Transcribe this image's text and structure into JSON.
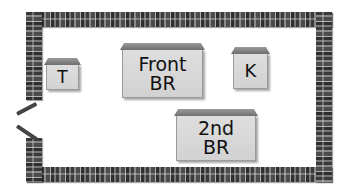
{
  "diagram": {
    "type": "floor-plan",
    "rooms": [
      {
        "id": "t",
        "label_lines": [
          "T"
        ]
      },
      {
        "id": "front-br",
        "label_lines": [
          "Front",
          "BR"
        ]
      },
      {
        "id": "k",
        "label_lines": [
          "K"
        ]
      },
      {
        "id": "2nd-br",
        "label_lines": [
          "2nd",
          "BR"
        ]
      }
    ],
    "features": [
      "outer-walls",
      "door-opening-left"
    ],
    "colors": {
      "wall": "#4a4a4a",
      "room_fill": "#d8d8d8",
      "roof": "#808080",
      "text": "#111111",
      "background": "#ffffff"
    }
  }
}
